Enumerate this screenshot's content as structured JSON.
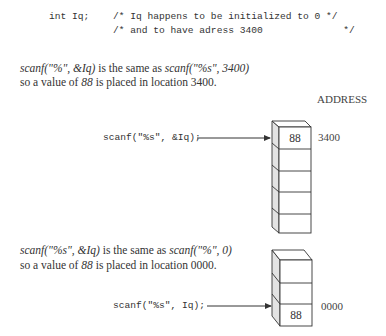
{
  "declaration": {
    "code": "int Iq;",
    "comment_line_1": "/* Iq happens to be initialized to 0 */",
    "comment_line_2": "/* and to have adress 3400              */"
  },
  "top_section": {
    "line1_italic_a": "scanf(\"%\", &Iq)",
    "line1_plain": " is the same as ",
    "line1_italic_b": "scanf(\"%s\", 3400)",
    "line2_plain_a": "so a value of ",
    "line2_italic": "88",
    "line2_plain_b": " is placed in location 3400.",
    "column_header": "ADDRESS",
    "call_code": "scanf(\"%s\", &Iq);",
    "stack_cells": [
      "88",
      "",
      "",
      "",
      ""
    ],
    "address_label": "3400"
  },
  "bottom_section": {
    "line1_italic_a": "scanf(\"%s\", &Iq)",
    "line1_plain": " is the same as ",
    "line1_italic_b": "scanf(\"%\", 0)",
    "line2_plain_a": "so a value of ",
    "line2_italic": "88",
    "line2_plain_b": " is placed in location 0000.",
    "call_code": "scanf(\"%s\", Iq);",
    "stack_cells": [
      "",
      "",
      "88"
    ],
    "address_label": "0000"
  },
  "colors": {
    "stroke": "#333333",
    "side_fill": "#e3e3e3",
    "text": "#333333"
  }
}
